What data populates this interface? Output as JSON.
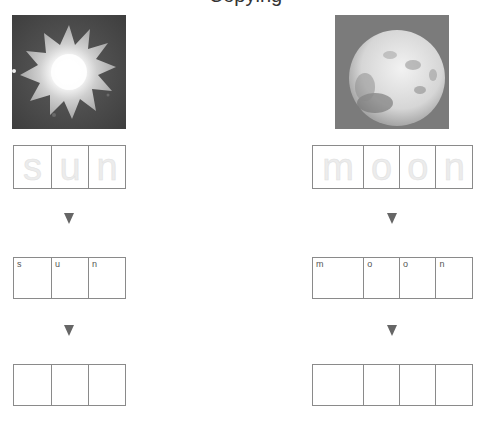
{
  "title": "Copying",
  "words": [
    {
      "id": "sun",
      "picture_icon": "sun-image",
      "letters": [
        "s",
        "u",
        "n"
      ],
      "trace_row": [
        "s",
        "u",
        "n"
      ],
      "copy_row": [
        "s",
        "u",
        "n"
      ],
      "write_row": [
        "",
        "",
        ""
      ]
    },
    {
      "id": "moon",
      "picture_icon": "moon-image",
      "letters": [
        "m",
        "o",
        "o",
        "n"
      ],
      "trace_row": [
        "m",
        "o",
        "o",
        "n"
      ],
      "copy_row": [
        "m",
        "o",
        "o",
        "n"
      ],
      "write_row": [
        "",
        "",
        "",
        ""
      ]
    }
  ],
  "arrow_icon": "down-triangle-icon",
  "colors": {
    "border": "#8a8a8a",
    "arrow": "#666666",
    "trace": "#ececec"
  }
}
